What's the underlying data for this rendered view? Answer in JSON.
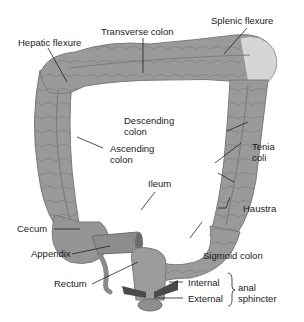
{
  "figure": {
    "colors": {
      "colon_fill": "#9a9a9a",
      "colon_shade": "#7f7f7f",
      "flexure_highlight": "#d6d6d6",
      "sphincter": "#4a4a4a",
      "leader_line": "#222222",
      "text": "#1a1a1a"
    },
    "labels": {
      "transverse_colon": "Transverse colon",
      "splenic_flexure": "Splenic flexure",
      "hepatic_flexure": "Hepatic flexure",
      "descending_colon": "Descending\ncolon",
      "ascending_colon": "Ascending\ncolon",
      "tenia_coli": "Tenia\ncoli",
      "ileum": "Ileum",
      "haustra": "Haustra",
      "cecum": "Cecum",
      "appendix": "Appendix",
      "sigmoid_colon": "Sigmoid colon",
      "rectum": "Rectum",
      "internal": "Internal",
      "external": "External",
      "anal_sphincter": "anal\nsphincter"
    }
  }
}
